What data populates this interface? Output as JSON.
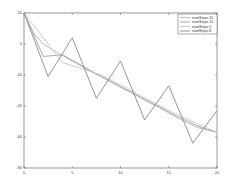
{
  "chart_data": {
    "type": "line",
    "title": "",
    "xlabel": "",
    "ylabel": "",
    "xlim": [
      0,
      20
    ],
    "ylim": [
      -80,
      20
    ],
    "xticks": [
      0,
      5,
      10,
      15,
      20
    ],
    "yticks": [
      20,
      0,
      -20,
      -40,
      -60,
      -80
    ],
    "grid": false,
    "legend_position": "upper-right",
    "series": [
      {
        "name": "numSteps 20",
        "color": "#b8b8b8",
        "x": [
          0,
          1,
          2,
          3,
          4,
          5,
          6,
          7,
          8,
          9,
          10,
          11,
          12,
          13,
          14,
          15,
          16,
          17,
          18,
          19,
          20
        ],
        "y": [
          20,
          7,
          0,
          -4,
          -7.5,
          -11,
          -14.5,
          -18,
          -21,
          -24.5,
          -28,
          -31,
          -34.5,
          -38,
          -41,
          -44.5,
          -48,
          -51,
          -54,
          -55.5,
          -57
        ]
      },
      {
        "name": "numSteps 10",
        "color": "#a0a0a0",
        "x": [
          0,
          2,
          4,
          6,
          8,
          10,
          12,
          14,
          16,
          18,
          20
        ],
        "y": [
          20,
          -8,
          -7,
          -14,
          -21,
          -27.5,
          -34,
          -40.5,
          -47,
          -53,
          -57
        ]
      },
      {
        "name": "numSteps 5",
        "color": "#c8c8c8",
        "x": [
          0,
          4,
          8,
          12,
          16,
          20
        ],
        "y": [
          20,
          -12,
          -20,
          -33,
          -46,
          -57
        ]
      },
      {
        "name": "numSteps 8",
        "color": "#8a8a8a",
        "x": [
          0,
          2.5,
          5,
          7.5,
          10,
          12.5,
          15,
          17.5,
          20
        ],
        "y": [
          20,
          -21,
          4,
          -35,
          -11,
          -49,
          -27,
          -64,
          -43
        ]
      }
    ]
  }
}
